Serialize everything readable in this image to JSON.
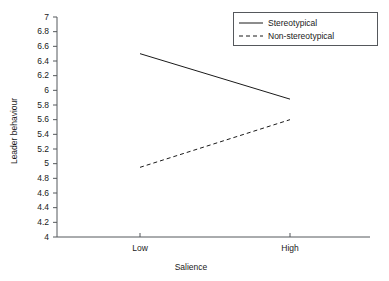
{
  "chart_data": {
    "type": "line",
    "title": "",
    "xlabel": "Salience",
    "ylabel": "Leader behaviour",
    "categories": [
      "Low",
      "High"
    ],
    "series": [
      {
        "name": "Stereotypical",
        "style": "solid",
        "values": [
          6.5,
          5.88
        ]
      },
      {
        "name": "Non-stereotypical",
        "style": "dashed",
        "values": [
          4.95,
          5.6
        ]
      }
    ],
    "ylim": [
      4,
      7
    ],
    "ytick_step": 0.2,
    "ytick_labels": [
      "7",
      "6.8",
      "6.6",
      "6.4",
      "6.2",
      "6",
      "5.8",
      "5.6",
      "5.4",
      "5.2",
      "5",
      "4.8",
      "4.6",
      "4.4",
      "4.2",
      "4"
    ],
    "xtick_labels": [
      "Low",
      "High"
    ],
    "grid": false,
    "legend_position": "top-right",
    "line_color": "#1a1a1a",
    "axis_color": "#55585c"
  },
  "legend": {
    "items": [
      {
        "label": "Stereotypical"
      },
      {
        "label": "Non-stereotypical"
      }
    ]
  },
  "axes": {
    "y_title": "Leader behaviour",
    "x_title": "Salience",
    "y_ticks": [
      {
        "label": "7",
        "value": 7.0
      },
      {
        "label": "6.8",
        "value": 6.8
      },
      {
        "label": "6.6",
        "value": 6.6
      },
      {
        "label": "6.4",
        "value": 6.4
      },
      {
        "label": "6.2",
        "value": 6.2
      },
      {
        "label": "6",
        "value": 6.0
      },
      {
        "label": "5.8",
        "value": 5.8
      },
      {
        "label": "5.6",
        "value": 5.6
      },
      {
        "label": "5.4",
        "value": 5.4
      },
      {
        "label": "5.2",
        "value": 5.2
      },
      {
        "label": "5",
        "value": 5.0
      },
      {
        "label": "4.8",
        "value": 4.8
      },
      {
        "label": "4.6",
        "value": 4.6
      },
      {
        "label": "4.4",
        "value": 4.4
      },
      {
        "label": "4.2",
        "value": 4.2
      },
      {
        "label": "4",
        "value": 4.0
      }
    ],
    "x_ticks": [
      {
        "label": "Low"
      },
      {
        "label": "High"
      }
    ]
  }
}
